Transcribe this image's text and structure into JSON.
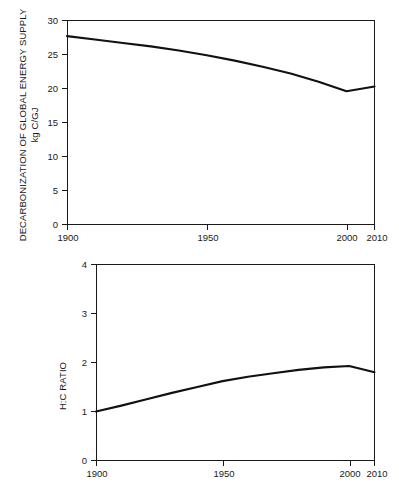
{
  "figure": {
    "background_color": "#ffffff",
    "line_color": "#111111",
    "axis_color": "#1a1a1a"
  },
  "chart_data": [
    {
      "type": "line",
      "id": "decarbonization",
      "title": "",
      "xlabel": "",
      "ylabel": "DECARBONIZATION OF GLOBAL ENERGY SUPPLY",
      "ylabel_units": "kg C/GJ",
      "xlim": [
        1900,
        2010
      ],
      "ylim": [
        0,
        30
      ],
      "xticks": [
        1900,
        1950,
        2000,
        2010
      ],
      "xticklabels": [
        "1900",
        "1950",
        "2000",
        "2010"
      ],
      "yticks": [
        0,
        5,
        10,
        15,
        20,
        25,
        30
      ],
      "yticklabels": [
        "0",
        "5",
        "10",
        "15",
        "20",
        "25",
        "30"
      ],
      "grid": false,
      "legend": false,
      "x": [
        1900,
        1910,
        1920,
        1930,
        1940,
        1950,
        1960,
        1970,
        1980,
        1990,
        2000,
        2010
      ],
      "values": [
        27.7,
        27.2,
        26.7,
        26.2,
        25.6,
        24.9,
        24.1,
        23.2,
        22.2,
        21.0,
        19.6,
        20.3
      ]
    },
    {
      "type": "line",
      "id": "hc-ratio",
      "title": "",
      "xlabel": "",
      "ylabel": "H:C RATIO",
      "ylabel_units": "",
      "xlim": [
        1900,
        2010
      ],
      "ylim": [
        0,
        4
      ],
      "xticks": [
        1900,
        1950,
        2000,
        2010
      ],
      "xticklabels": [
        "1900",
        "1950",
        "2000",
        "2010"
      ],
      "yticks": [
        0,
        1,
        2,
        3,
        4
      ],
      "yticklabels": [
        "0",
        "1",
        "2",
        "3",
        "4"
      ],
      "grid": false,
      "legend": false,
      "x": [
        1900,
        1910,
        1920,
        1930,
        1940,
        1950,
        1960,
        1970,
        1980,
        1990,
        2000,
        2010
      ],
      "values": [
        1.0,
        1.12,
        1.25,
        1.38,
        1.5,
        1.62,
        1.71,
        1.78,
        1.85,
        1.9,
        1.93,
        1.8
      ]
    }
  ]
}
